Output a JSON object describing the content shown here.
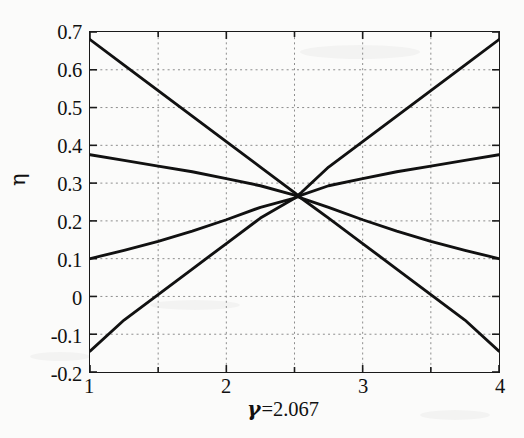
{
  "chart_data": {
    "type": "line",
    "title": "",
    "subtitle": "",
    "xlabel": "γ =2.067",
    "xlabel_symbol": "γ",
    "xlabel_value": "=2.067",
    "ylabel": "η",
    "xlim": [
      1,
      4
    ],
    "ylim": [
      -0.2,
      0.7
    ],
    "xticks": [
      1,
      2,
      3,
      4
    ],
    "xtick_labels": [
      "1",
      "2",
      "3",
      "4"
    ],
    "xminor_ticks": [
      1.5,
      2.5,
      3.5
    ],
    "yticks": [
      -0.2,
      -0.1,
      0,
      0.1,
      0.2,
      0.3,
      0.4,
      0.5,
      0.6,
      0.7
    ],
    "ytick_labels": [
      "-0.2",
      "-0.1",
      "0",
      "0.1",
      "0.2",
      "0.3",
      "0.4",
      "0.5",
      "0.6",
      "0.7"
    ],
    "grid": true,
    "grid_style": "dotted",
    "grid_color": "#8c8c8c",
    "legend": false,
    "legend_position": "none",
    "line_color": "#111111",
    "crossing_point": {
      "x": 2.55,
      "y": 0.26
    },
    "series": [
      {
        "name": "steep-descending",
        "comment": "starts high-left, ends low-right",
        "x": [
          1.0,
          1.25,
          1.5,
          1.75,
          2.0,
          2.25,
          2.5,
          2.55,
          2.75,
          3.0,
          3.25,
          3.5,
          3.75,
          4.0
        ],
        "values": [
          0.68,
          0.6125,
          0.545,
          0.4775,
          0.41,
          0.3425,
          0.275,
          0.26,
          0.2075,
          0.14,
          0.0725,
          0.005,
          -0.0625,
          -0.145
        ]
      },
      {
        "name": "shallow-descending",
        "comment": "starts 0.375 at x=1, gently falls, slight bend near crossing, ends 0.10",
        "x": [
          1.0,
          1.25,
          1.5,
          1.75,
          2.0,
          2.25,
          2.5,
          2.55,
          2.75,
          3.0,
          3.25,
          3.5,
          3.75,
          4.0
        ],
        "values": [
          0.375,
          0.36,
          0.345,
          0.33,
          0.312,
          0.293,
          0.268,
          0.26,
          0.236,
          0.203,
          0.173,
          0.146,
          0.122,
          0.1
        ]
      },
      {
        "name": "shallow-ascending",
        "comment": "starts 0.10 at x=1, gently rises, slight bend near crossing, ends 0.375",
        "x": [
          1.0,
          1.25,
          1.5,
          1.75,
          2.0,
          2.25,
          2.5,
          2.55,
          2.75,
          3.0,
          3.25,
          3.5,
          3.75,
          4.0
        ],
        "values": [
          0.1,
          0.122,
          0.146,
          0.173,
          0.203,
          0.236,
          0.26,
          0.268,
          0.293,
          0.312,
          0.33,
          0.345,
          0.36,
          0.375
        ]
      },
      {
        "name": "steep-ascending",
        "comment": "starts low-left, ends high-right",
        "x": [
          1.0,
          1.25,
          1.5,
          1.75,
          2.0,
          2.25,
          2.5,
          2.55,
          2.75,
          3.0,
          3.25,
          3.5,
          3.75,
          4.0
        ],
        "values": [
          -0.145,
          -0.0625,
          0.005,
          0.0725,
          0.14,
          0.2075,
          0.26,
          0.275,
          0.3425,
          0.41,
          0.4775,
          0.545,
          0.6125,
          0.68
        ]
      }
    ]
  }
}
